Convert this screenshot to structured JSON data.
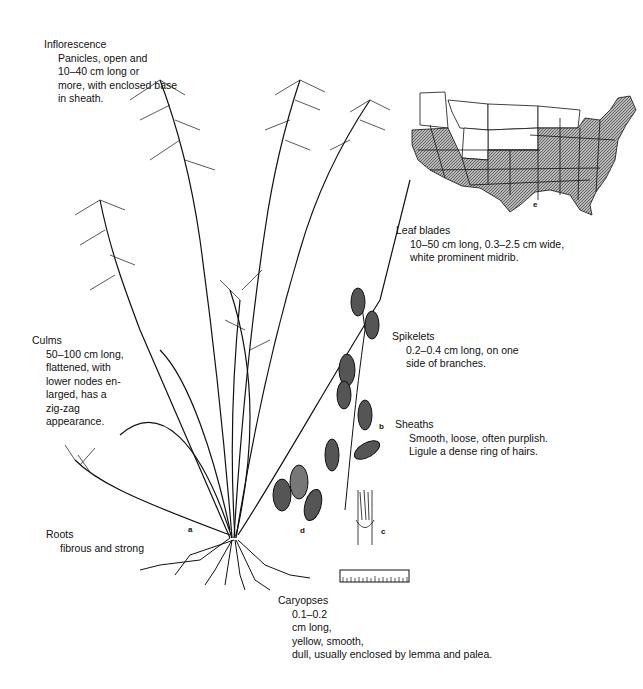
{
  "labels": {
    "inflorescence": {
      "title": "Inflorescence",
      "lines": [
        "Panicles, open and",
        "10–40 cm long or",
        "more, with enclosed base",
        "in sheath."
      ]
    },
    "leaf_blades": {
      "title": "Leaf blades",
      "lines": [
        "10–50 cm long, 0.3–2.5 cm wide,",
        "white prominent midrib."
      ]
    },
    "spikelets": {
      "title": "Spikelets",
      "lines": [
        "0.2–0.4 cm long, on one",
        "side of branches."
      ]
    },
    "culms": {
      "title": "Culms",
      "lines": [
        "50–100 cm long,",
        "flattened, with",
        "lower nodes en-",
        "larged, has a",
        "zig-zag",
        "appearance."
      ]
    },
    "sheaths": {
      "title": "Sheaths",
      "lines": [
        "Smooth, loose, often purplish.",
        "Ligule a dense ring of hairs."
      ]
    },
    "roots": {
      "title": "Roots",
      "lines": [
        "fibrous and strong"
      ]
    },
    "caryopses": {
      "title": "Caryopses",
      "lines": [
        "0.1–0.2",
        "cm long,",
        "yellow, smooth,",
        "dull, usually enclosed by lemma and palea."
      ]
    }
  },
  "figure_letters": {
    "a": "a",
    "b": "b",
    "c": "c",
    "d": "d",
    "e": "e"
  },
  "map": {
    "description": "US distribution map, shaded states indicate range",
    "shade_color": "#8a8a8a",
    "unshaded_color": "#ffffff"
  },
  "colors": {
    "ink": "#111111",
    "background": "#ffffff"
  }
}
